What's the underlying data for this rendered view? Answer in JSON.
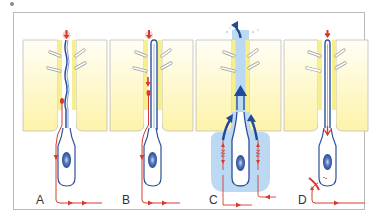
{
  "figure": {
    "panels": [
      {
        "id": "A",
        "label": "A",
        "state": "resting - wavy cilium, red signal entering base"
      },
      {
        "id": "B",
        "label": "B",
        "state": "straight cilium, red signal moving downward"
      },
      {
        "id": "C",
        "label": "C",
        "state": "blue upward flow through canal, red bidirectional arrows"
      },
      {
        "id": "D",
        "label": "D",
        "state": "red dot in cell body, barrier at base"
      }
    ],
    "colors": {
      "tissue_yellow": "#fdf6b8",
      "tissue_fade": "#fffde8",
      "cell_outline": "#2d4f9a",
      "nucleus": "#3b5fa8",
      "signal_red": "#d63a2f",
      "flow_blue": "#1f4a99",
      "flow_halo": "#bcd9f3",
      "frame_border": "#b9b9b9"
    }
  }
}
